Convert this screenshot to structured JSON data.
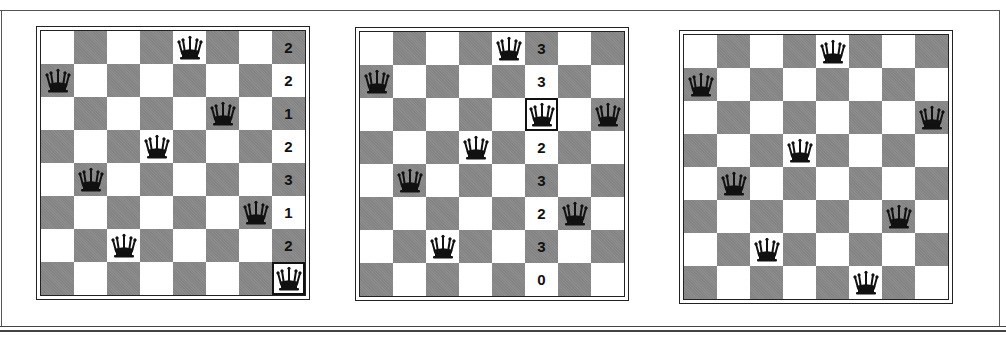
{
  "colors": {
    "light": "#ffffff",
    "dark": "#8c8c8c",
    "piece": "#111111"
  },
  "piece_icon": "queen-icon",
  "boards": [
    {
      "id": "board-1",
      "left": 36,
      "top": 26,
      "queens": [
        [
          0,
          4
        ],
        [
          1,
          0
        ],
        [
          2,
          5
        ],
        [
          3,
          3
        ],
        [
          4,
          1
        ],
        [
          5,
          6
        ],
        [
          6,
          2
        ],
        [
          7,
          7
        ]
      ],
      "highlight": [
        7,
        7
      ],
      "numbers": [
        {
          "row": 0,
          "col": 7,
          "value": "2"
        },
        {
          "row": 1,
          "col": 7,
          "value": "2"
        },
        {
          "row": 2,
          "col": 7,
          "value": "1"
        },
        {
          "row": 3,
          "col": 7,
          "value": "2"
        },
        {
          "row": 4,
          "col": 7,
          "value": "3"
        },
        {
          "row": 5,
          "col": 7,
          "value": "1"
        },
        {
          "row": 6,
          "col": 7,
          "value": "2"
        }
      ]
    },
    {
      "id": "board-2",
      "left": 355,
      "top": 27,
      "queens": [
        [
          0,
          4
        ],
        [
          1,
          0
        ],
        [
          2,
          5
        ],
        [
          2,
          7
        ],
        [
          3,
          3
        ],
        [
          4,
          1
        ],
        [
          5,
          6
        ],
        [
          6,
          2
        ]
      ],
      "highlight": [
        2,
        5
      ],
      "numbers": [
        {
          "row": 0,
          "col": 5,
          "value": "3"
        },
        {
          "row": 1,
          "col": 5,
          "value": "3"
        },
        {
          "row": 3,
          "col": 5,
          "value": "2"
        },
        {
          "row": 4,
          "col": 5,
          "value": "3"
        },
        {
          "row": 5,
          "col": 5,
          "value": "2"
        },
        {
          "row": 6,
          "col": 5,
          "value": "3"
        },
        {
          "row": 7,
          "col": 5,
          "value": "0"
        }
      ]
    },
    {
      "id": "board-3",
      "left": 679,
      "top": 30,
      "queens": [
        [
          0,
          4
        ],
        [
          1,
          0
        ],
        [
          2,
          7
        ],
        [
          3,
          3
        ],
        [
          4,
          1
        ],
        [
          5,
          6
        ],
        [
          6,
          2
        ],
        [
          7,
          5
        ]
      ],
      "highlight": null,
      "numbers": []
    }
  ]
}
